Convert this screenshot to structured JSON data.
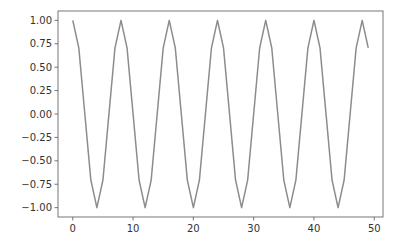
{
  "chart_data": {
    "type": "line",
    "title": "",
    "xlabel": "",
    "ylabel": "",
    "xlim": [
      -2.45,
      51.45
    ],
    "ylim": [
      -1.1,
      1.1
    ],
    "grid": false,
    "legend": null,
    "xticks": [
      0,
      10,
      20,
      30,
      40,
      50
    ],
    "xtick_labels": [
      "0",
      "10",
      "20",
      "30",
      "40",
      "50"
    ],
    "yticks": [
      1.0,
      0.75,
      0.5,
      0.25,
      0.0,
      -0.25,
      -0.5,
      -0.75,
      -1.0
    ],
    "ytick_labels": [
      "1.00",
      "0.75",
      "0.50",
      "0.25",
      "0.00",
      "−0.25",
      "−0.50",
      "−0.75",
      "−1.00"
    ],
    "series": [
      {
        "name": "cos",
        "color": "#8c8c8c",
        "x": [
          0,
          1,
          2,
          3,
          4,
          5,
          6,
          7,
          8,
          9,
          10,
          11,
          12,
          13,
          14,
          15,
          16,
          17,
          18,
          19,
          20,
          21,
          22,
          23,
          24,
          25,
          26,
          27,
          28,
          29,
          30,
          31,
          32,
          33,
          34,
          35,
          36,
          37,
          38,
          39,
          40,
          41,
          42,
          43,
          44,
          45,
          46,
          47,
          48,
          49
        ],
        "values": [
          1.0,
          0.707,
          0.0,
          -0.707,
          -1.0,
          -0.707,
          0.0,
          0.707,
          1.0,
          0.707,
          0.0,
          -0.707,
          -1.0,
          -0.707,
          0.0,
          0.707,
          1.0,
          0.707,
          0.0,
          -0.707,
          -1.0,
          -0.707,
          0.0,
          0.707,
          1.0,
          0.707,
          0.0,
          -0.707,
          -1.0,
          -0.707,
          0.0,
          0.707,
          1.0,
          0.707,
          0.0,
          -0.707,
          -1.0,
          -0.707,
          0.0,
          0.707,
          1.0,
          0.707,
          0.0,
          -0.707,
          -1.0,
          -0.707,
          0.0,
          0.707,
          1.0,
          0.707
        ]
      }
    ]
  },
  "style": {
    "axes_color": "#555555",
    "line_color": "#8c8c8c",
    "background": "#ffffff"
  }
}
